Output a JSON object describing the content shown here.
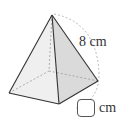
{
  "figure": {
    "type": "square-pyramid",
    "edge_label": "8 cm",
    "answer_unit": "cm",
    "colors": {
      "face_left": "#eeeeee",
      "face_right": "#d9d9d9",
      "edges": "#333333",
      "hidden_edges": "#999999",
      "arc": "#aaaaaa"
    }
  }
}
